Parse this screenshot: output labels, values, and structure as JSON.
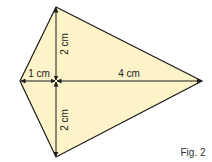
{
  "figure": {
    "caption": "Fig. 2",
    "shape": "kite",
    "fill_color": "#fcf3c8",
    "stroke_color": "#1a1a1a",
    "vertices": {
      "top": [
        56,
        7
      ],
      "right": [
        202,
        81
      ],
      "bottom": [
        56,
        157
      ],
      "left": [
        20,
        81
      ]
    },
    "intersection": [
      56,
      81
    ],
    "measurements": {
      "top_segment": "2 cm",
      "bottom_segment": "2 cm",
      "left_segment": "1 cm",
      "right_segment": "4 cm"
    }
  }
}
